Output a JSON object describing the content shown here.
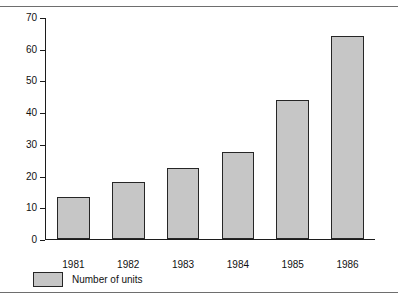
{
  "page": {
    "header_remnant": "",
    "rule_color": "#6e6e6e"
  },
  "legend": {
    "label": "Number of units",
    "swatch_color": "#c6c6c6",
    "border_color": "#262626"
  },
  "chart_data": {
    "type": "bar",
    "title": "",
    "xlabel": "",
    "ylabel": "",
    "categories": [
      "1981",
      "1982",
      "1983",
      "1984",
      "1985",
      "1986"
    ],
    "values": [
      13.2,
      18.1,
      22.4,
      27.7,
      44.1,
      64.4
    ],
    "series": [
      {
        "name": "Number of units",
        "values": [
          13.2,
          18.1,
          22.4,
          27.7,
          44.1,
          64.4
        ]
      }
    ],
    "ylim": [
      0,
      70
    ],
    "yticks": [
      0,
      10,
      20,
      30,
      40,
      50,
      60,
      70
    ],
    "ytick_labels": [
      "0",
      "10",
      "20",
      "30",
      "40",
      "50",
      "60",
      "70"
    ],
    "grid": false,
    "legend_position": "below-left",
    "bar_fill": "#c6c6c6",
    "bar_border": "#262626"
  }
}
